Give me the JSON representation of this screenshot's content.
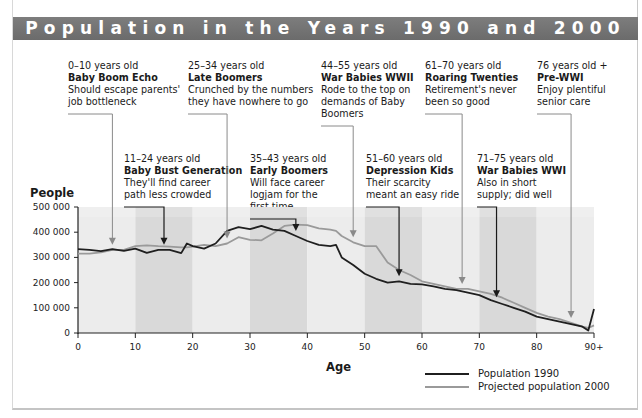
{
  "title": "Population in the Years 1990 and 2000",
  "annotations": [
    {
      "age": "0–10 years old",
      "name": "Baby Boom Echo",
      "desc": [
        "Should escape parents'",
        "job bottleneck"
      ],
      "row": "top",
      "x": 68,
      "y": 60,
      "arrow_age": 6,
      "arrow_color": "#8a8a8a"
    },
    {
      "age": "11–24 years old",
      "name": "Baby Bust Generation",
      "desc": [
        "They'll find career",
        "path less crowded"
      ],
      "row": "bottom",
      "x": 124,
      "y": 153,
      "arrow_age": 15,
      "arrow_color": "#1a1a1a"
    },
    {
      "age": "25–34 years old",
      "name": "Late Boomers",
      "desc": [
        "Crunched by the numbers",
        "they have nowhere to go"
      ],
      "row": "top",
      "x": 188,
      "y": 60,
      "arrow_age": 26,
      "arrow_color": "#8a8a8a"
    },
    {
      "age": "35–43 years old",
      "name": "Early Boomers",
      "desc": [
        "Will face career",
        "logjam for the",
        "first time"
      ],
      "row": "bottom",
      "x": 250,
      "y": 153,
      "arrow_age": 38,
      "arrow_color": "#1a1a1a"
    },
    {
      "age": "44–55 years old",
      "name": "War Babies WWII",
      "desc": [
        "Rode to the top on",
        "demands of Baby",
        "Boomers"
      ],
      "row": "top",
      "x": 321,
      "y": 60,
      "arrow_age": 48,
      "arrow_color": "#8a8a8a"
    },
    {
      "age": "51–60 years old",
      "name": "Depression Kids",
      "desc": [
        "Their scarcity",
        "meant an easy ride"
      ],
      "row": "bottom",
      "x": 366,
      "y": 153,
      "arrow_age": 56,
      "arrow_color": "#1a1a1a"
    },
    {
      "age": "61–70 years old",
      "name": "Roaring Twenties",
      "desc": [
        "Retirement's never",
        "been so good"
      ],
      "row": "top",
      "x": 425,
      "y": 60,
      "arrow_age": 67,
      "arrow_color": "#8a8a8a"
    },
    {
      "age": "71–75 years old",
      "name": "War Babies WWI",
      "desc": [
        "Also in short",
        "supply; did well"
      ],
      "row": "bottom",
      "x": 477,
      "y": 153,
      "arrow_age": 73,
      "arrow_color": "#1a1a1a"
    },
    {
      "age": "76 years old +",
      "name": "Pre-WWI",
      "desc": [
        "Enjoy plentiful",
        "senior care"
      ],
      "row": "top",
      "x": 537,
      "y": 60,
      "arrow_age": 86,
      "arrow_color": "#8a8a8a"
    }
  ],
  "chart_data": {
    "type": "line",
    "title": "Population in the Years 1990 and 2000",
    "xlabel": "Age",
    "ylabel": "People",
    "xlim": [
      0,
      90
    ],
    "ylim": [
      0,
      500000
    ],
    "x_ticks": [
      "0",
      "10",
      "20",
      "30",
      "40",
      "50",
      "60",
      "70",
      "80",
      "90+"
    ],
    "y_ticks": [
      "0",
      "100 000",
      "200 000",
      "300 000",
      "400 000",
      "500 000"
    ],
    "grid": false,
    "legend_position": "bottom-right",
    "x": [
      0,
      2,
      4,
      6,
      8,
      10,
      12,
      14,
      16,
      18,
      19,
      20,
      22,
      24,
      26,
      28,
      30,
      32,
      34,
      36,
      38,
      40,
      42,
      44,
      45,
      46,
      48,
      50,
      52,
      54,
      56,
      58,
      60,
      62,
      64,
      66,
      68,
      70,
      72,
      74,
      76,
      78,
      80,
      82,
      84,
      86,
      88,
      89,
      90
    ],
    "series": [
      {
        "name": "Population 1990",
        "color": "#1f1f1f",
        "values": [
          333000,
          330000,
          325000,
          333000,
          326000,
          335000,
          318000,
          330000,
          330000,
          317000,
          355000,
          345000,
          335000,
          355000,
          405000,
          420000,
          412000,
          425000,
          410000,
          405000,
          385000,
          365000,
          350000,
          345000,
          350000,
          300000,
          270000,
          235000,
          215000,
          200000,
          205000,
          195000,
          193000,
          185000,
          175000,
          170000,
          160000,
          150000,
          130000,
          115000,
          100000,
          85000,
          65000,
          55000,
          45000,
          35000,
          25000,
          10000,
          95000
        ]
      },
      {
        "name": "Projected population 2000",
        "color": "#9a9a9a",
        "values": [
          315000,
          315000,
          320000,
          330000,
          330000,
          345000,
          348000,
          345000,
          343000,
          340000,
          340000,
          343000,
          350000,
          345000,
          355000,
          380000,
          370000,
          368000,
          395000,
          425000,
          430000,
          428000,
          415000,
          410000,
          405000,
          385000,
          360000,
          345000,
          345000,
          280000,
          250000,
          230000,
          205000,
          195000,
          185000,
          175000,
          175000,
          165000,
          155000,
          140000,
          120000,
          100000,
          80000,
          65000,
          55000,
          40000,
          25000,
          20000,
          30000
        ]
      }
    ],
    "annotations": [
      {
        "age_range": "0–10",
        "label": "Baby Boom Echo",
        "text": "Should escape parents' job bottleneck"
      },
      {
        "age_range": "11–24",
        "label": "Baby Bust Generation",
        "text": "They'll find career path less crowded"
      },
      {
        "age_range": "25–34",
        "label": "Late Boomers",
        "text": "Crunched by the numbers they have nowhere to go"
      },
      {
        "age_range": "35–43",
        "label": "Early Boomers",
        "text": "Will face career logjam for the first time"
      },
      {
        "age_range": "44–55",
        "label": "War Babies WWII",
        "text": "Rode to the top on demands of Baby Boomers"
      },
      {
        "age_range": "51–60",
        "label": "Depression Kids",
        "text": "Their scarcity meant an easy ride"
      },
      {
        "age_range": "61–70",
        "label": "Roaring Twenties",
        "text": "Retirement's never been so good"
      },
      {
        "age_range": "71–75",
        "label": "War Babies WWI",
        "text": "Also in short supply; did well"
      },
      {
        "age_range": "76+",
        "label": "Pre-WWI",
        "text": "Enjoy plentiful senior care"
      }
    ]
  },
  "axes": {
    "ylabel": "People",
    "xlabel": "Age"
  },
  "legend": [
    {
      "label": "Population 1990",
      "color": "#1f1f1f"
    },
    {
      "label": "Projected population 2000",
      "color": "#9a9a9a"
    }
  ],
  "colors": {
    "title_bar": "#737373",
    "band_light": "#ececec",
    "band_dark": "#d9d9d9",
    "line_1990": "#1f1f1f",
    "line_2000": "#9a9a9a"
  }
}
